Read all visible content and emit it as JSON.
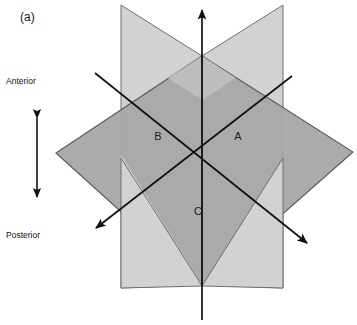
{
  "figure": {
    "tag": "(a)",
    "tag_x": 20,
    "tag_y": 18
  },
  "orientation_axis": {
    "top_label": "Anterior",
    "bottom_label": "Posterior",
    "top_label_x": 6,
    "top_label_y": 82,
    "bottom_label_x": 6,
    "bottom_label_y": 236,
    "arrow_x": 37,
    "arrow_top_y": 115,
    "arrow_bottom_y": 200,
    "color": "#111111"
  },
  "planes": [
    {
      "id": "plane-b",
      "label": "B",
      "label_x": 158,
      "label_y": 137,
      "fill": "#d2d2d2",
      "stroke": "#6e6e6e",
      "points": "121,5 202,56 202,285 121,288",
      "description": "left vertical sagittal-style plane"
    },
    {
      "id": "plane-a",
      "label": "A",
      "label_x": 238,
      "label_y": 137,
      "fill": "#d2d2d2",
      "stroke": "#6e6e6e",
      "points": "283,5 283,288 202,285 202,56",
      "description": "right vertical plane"
    },
    {
      "id": "plane-c",
      "label": "C",
      "label_x": 198,
      "label_y": 212,
      "fill": "#a8a8a8",
      "stroke": "#5a5a5a",
      "points": "56,153 202,56 353,152 202,285",
      "description": "horizontal transverse plane"
    }
  ],
  "axis_lines": [
    {
      "id": "vertical-axis",
      "x1": 202,
      "y1": 320,
      "x2": 202,
      "y2": 10,
      "arrow_end": true,
      "color": "#111111"
    },
    {
      "id": "diagonal-axis-nw-se",
      "x1": 95,
      "y1": 73,
      "x2": 310,
      "y2": 245,
      "arrow_end": true,
      "color": "#111111"
    },
    {
      "id": "diagonal-axis-ne-sw",
      "x1": 292,
      "y1": 76,
      "x2": 93,
      "y2": 230,
      "arrow_end": true,
      "color": "#111111"
    }
  ],
  "colors": {
    "background": "#ffffff",
    "plane_light": "#d2d2d2",
    "plane_dark": "#a8a8a8",
    "line": "#111111",
    "text": "#1a1a1a"
  }
}
